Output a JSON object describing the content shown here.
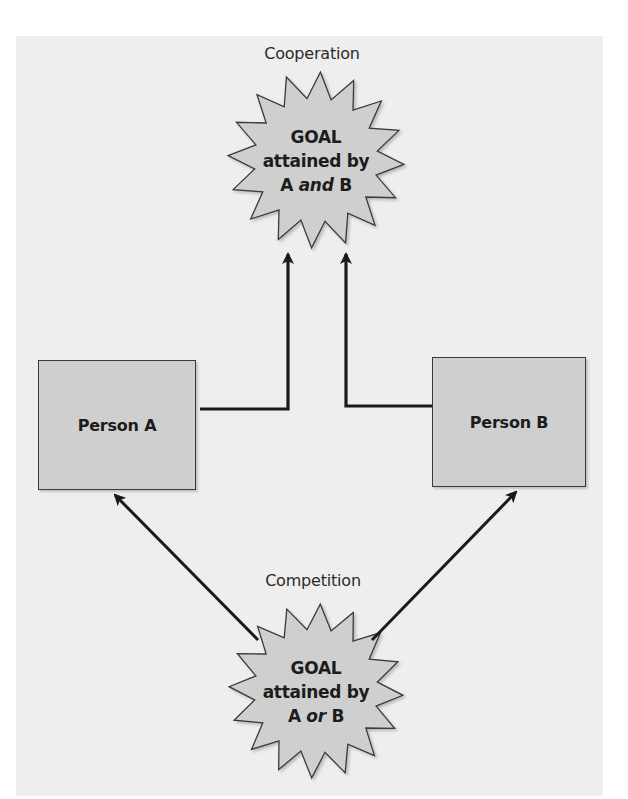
{
  "diagram": {
    "cooperation": {
      "title": "Cooperation",
      "goal": {
        "line1": "GOAL",
        "line2": "attained by",
        "line3_prefix": "A ",
        "line3_conj": "and",
        "line3_suffix": " B"
      }
    },
    "competition": {
      "title": "Competition",
      "goal": {
        "line1": "GOAL",
        "line2": "attained by",
        "line3_prefix": "A ",
        "line3_conj": "or",
        "line3_suffix": " B"
      }
    },
    "persons": [
      {
        "label": "Person A"
      },
      {
        "label": "Person B"
      }
    ],
    "colors": {
      "panel": "#eeeeee",
      "shape_fill": "#cfcfcf",
      "stroke": "#1a1a1a",
      "text": "#1c1c1c"
    }
  }
}
